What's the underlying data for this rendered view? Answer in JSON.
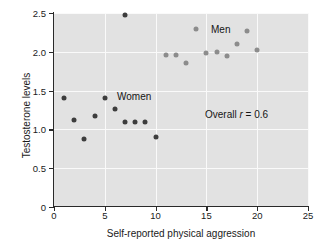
{
  "chart_data": {
    "type": "scatter",
    "title": "",
    "xlabel": "Self-reported physical aggression",
    "ylabel": "Testosterone levels",
    "xlim": [
      0,
      25
    ],
    "ylim": [
      0,
      2.5
    ],
    "xticks": [
      0,
      5,
      10,
      15,
      20,
      25
    ],
    "yticks": [
      0,
      0.5,
      1.0,
      1.5,
      2.0,
      2.5
    ],
    "xtick_labels": [
      "0",
      "5",
      "10",
      "15",
      "20",
      "25"
    ],
    "ytick_labels": [
      "0",
      "0.5",
      "1.0",
      "1.5",
      "2.0",
      "2.5"
    ],
    "grid": true,
    "grid_color": "#fafafa",
    "plot_background": "#e2e2e2",
    "legend_position": "inline-annotations",
    "series": [
      {
        "name": "Women",
        "color": "#3d3d3d",
        "marker": "circle",
        "points": [
          {
            "x": 1,
            "y": 1.4
          },
          {
            "x": 2,
            "y": 1.12
          },
          {
            "x": 3,
            "y": 0.88
          },
          {
            "x": 4,
            "y": 1.17
          },
          {
            "x": 5,
            "y": 1.4
          },
          {
            "x": 6,
            "y": 1.26
          },
          {
            "x": 7,
            "y": 1.09
          },
          {
            "x": 7,
            "y": 2.47
          },
          {
            "x": 8,
            "y": 1.1
          },
          {
            "x": 9,
            "y": 1.1
          },
          {
            "x": 10,
            "y": 0.9
          }
        ]
      },
      {
        "name": "Men",
        "color": "#8c8c8c",
        "marker": "circle",
        "points": [
          {
            "x": 11,
            "y": 1.96
          },
          {
            "x": 12,
            "y": 1.96
          },
          {
            "x": 13,
            "y": 1.86
          },
          {
            "x": 14,
            "y": 2.3
          },
          {
            "x": 15,
            "y": 1.99
          },
          {
            "x": 16,
            "y": 2.0
          },
          {
            "x": 17,
            "y": 1.95
          },
          {
            "x": 18,
            "y": 2.1
          },
          {
            "x": 19,
            "y": 2.27
          },
          {
            "x": 20,
            "y": 2.02
          }
        ]
      }
    ],
    "annotations": [
      {
        "text": "Men",
        "x": 16.4,
        "y": 2.3
      },
      {
        "text": "Women",
        "x": 7.2,
        "y": 1.42
      },
      {
        "text": "Overall r = 0.6",
        "x": 15.0,
        "y": 1.28
      }
    ]
  },
  "labels": {
    "ylabel": "Testosterone levels",
    "xlabel": "Self-reported physical aggression",
    "annot_men": "Men",
    "annot_women": "Women",
    "annot_r_prefix": "Overall ",
    "annot_r_symbol": "r",
    "annot_r_suffix": " = 0.6"
  }
}
